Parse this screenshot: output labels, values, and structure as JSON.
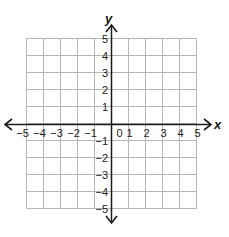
{
  "diagram": {
    "type": "coordinate-plane",
    "x_axis": {
      "label": "x",
      "min": -5,
      "max": 5,
      "step": 1,
      "ticks": [
        "-5",
        "-4",
        "-3",
        "-2",
        "-1",
        "0",
        "1",
        "2",
        "3",
        "4",
        "5"
      ]
    },
    "y_axis": {
      "label": "y",
      "min": -5,
      "max": 5,
      "step": 1,
      "ticks_positive": [
        "1",
        "2",
        "3",
        "4",
        "5"
      ],
      "ticks_negative": [
        "-1",
        "-2",
        "-3",
        "-4",
        "-5"
      ]
    },
    "grid": true,
    "colors": {
      "grid": "#b5b5b5",
      "axis": "#1a1a1a",
      "background": "#ffffff"
    }
  }
}
